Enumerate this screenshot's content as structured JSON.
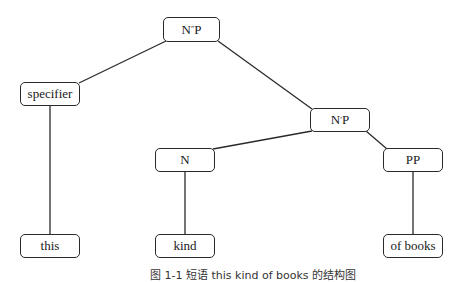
{
  "diagram": {
    "type": "syntax-tree",
    "nodes": {
      "root": {
        "label_base": "N",
        "label_prime": "″",
        "label_tail": "P"
      },
      "specifier": {
        "label": "specifier"
      },
      "nbarp": {
        "label_base": "N",
        "label_prime": "′",
        "label_tail": "P"
      },
      "n": {
        "label": "N"
      },
      "pp": {
        "label": "PP"
      },
      "this": {
        "label": "this"
      },
      "kind": {
        "label": "kind"
      },
      "of_books": {
        "label": "of books"
      }
    },
    "edges": [
      [
        "N″P",
        "specifier"
      ],
      [
        "N″P",
        "N′P"
      ],
      [
        "N′P",
        "N"
      ],
      [
        "N′P",
        "PP"
      ],
      [
        "specifier",
        "this"
      ],
      [
        "N",
        "kind"
      ],
      [
        "PP",
        "of books"
      ]
    ],
    "caption": "图 1-1  短语 this kind of books 的结构图"
  }
}
